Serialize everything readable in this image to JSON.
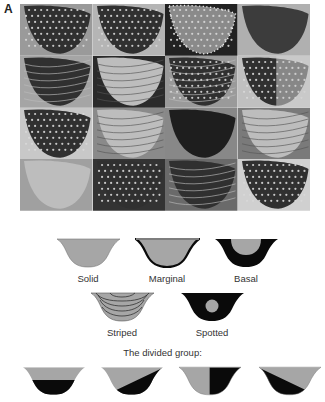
{
  "figure": {
    "panel_label": "A",
    "photo_grid": {
      "rows": 4,
      "cols": 4,
      "tiles": [
        {
          "pattern": "spotted-dark",
          "bg": "#9a9a9a"
        },
        {
          "pattern": "spotted-dark",
          "bg": "#b5b5b5"
        },
        {
          "pattern": "marginal-dots",
          "bg": "#222222"
        },
        {
          "pattern": "solid-dark",
          "bg": "#b0b0b0"
        },
        {
          "pattern": "striped-dark",
          "bg": "#a5a5a5"
        },
        {
          "pattern": "veined-light",
          "bg": "#2a2a2a"
        },
        {
          "pattern": "striped-dots",
          "bg": "#9a9a9a"
        },
        {
          "pattern": "divided-spots",
          "bg": "#c0c0c0"
        },
        {
          "pattern": "spotted-dark",
          "bg": "#c8c8c8"
        },
        {
          "pattern": "veined-light",
          "bg": "#8a8a8a"
        },
        {
          "pattern": "basal-dark",
          "bg": "#888888"
        },
        {
          "pattern": "banded-light",
          "bg": "#7a7a7a"
        },
        {
          "pattern": "solid-light",
          "bg": "#a0a0a0"
        },
        {
          "pattern": "spotted-mixed",
          "bg": "#333333"
        },
        {
          "pattern": "striped-mixed",
          "bg": "#6a6a6a"
        },
        {
          "pattern": "spotted-dark",
          "bg": "#d0d0d0"
        }
      ]
    },
    "pattern_types": [
      {
        "label": "Solid"
      },
      {
        "label": "Marginal"
      },
      {
        "label": "Basal"
      },
      {
        "label": "Striped"
      },
      {
        "label": "Spotted"
      }
    ],
    "divided_group": {
      "title": "The divided group:",
      "variants": [
        {
          "split": "horizontal"
        },
        {
          "split": "diagonal-up"
        },
        {
          "split": "vertical"
        },
        {
          "split": "diagonal-down"
        }
      ]
    },
    "colors": {
      "fill_gray": "#a6a6a6",
      "pattern_black": "#0a0a0a",
      "text": "#333333"
    }
  }
}
